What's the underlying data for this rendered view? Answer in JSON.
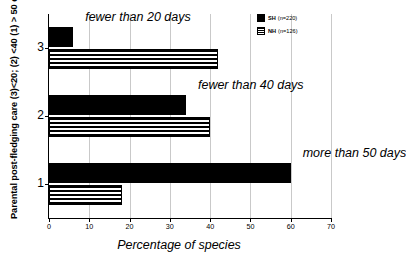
{
  "chart_data": {
    "type": "bar",
    "orientation": "horizontal",
    "title": "",
    "xlabel": "Percentage of species",
    "ylabel": "Parental post-fledging care (3)<20; (2) <40 (1) > 50 days",
    "categories": [
      "3",
      "2",
      "1"
    ],
    "xlim": [
      0,
      70
    ],
    "xticks": [
      0,
      10,
      20,
      30,
      40,
      50,
      60,
      70
    ],
    "xtick_labels": [
      "0",
      "10",
      "20",
      "30",
      "40",
      "50",
      "60",
      "70"
    ],
    "grid": true,
    "grid_axis": "x",
    "legend_position": "top-right",
    "series": [
      {
        "name": "SH",
        "label": "SH",
        "n_label": "(n=220)",
        "fill": "solid-black",
        "color": "#000000",
        "values": [
          6,
          34,
          60
        ]
      },
      {
        "name": "NH",
        "label": "NH",
        "n_label": "(n=126)",
        "fill": "horizontal-stripes",
        "color": "#000000",
        "values": [
          42,
          40,
          18
        ]
      }
    ],
    "annotations": [
      {
        "text": "fewer than 20 days",
        "category": "3"
      },
      {
        "text": "fewer than 40 days",
        "category": "2"
      },
      {
        "text": "more than 50 days",
        "category": "1"
      }
    ]
  }
}
